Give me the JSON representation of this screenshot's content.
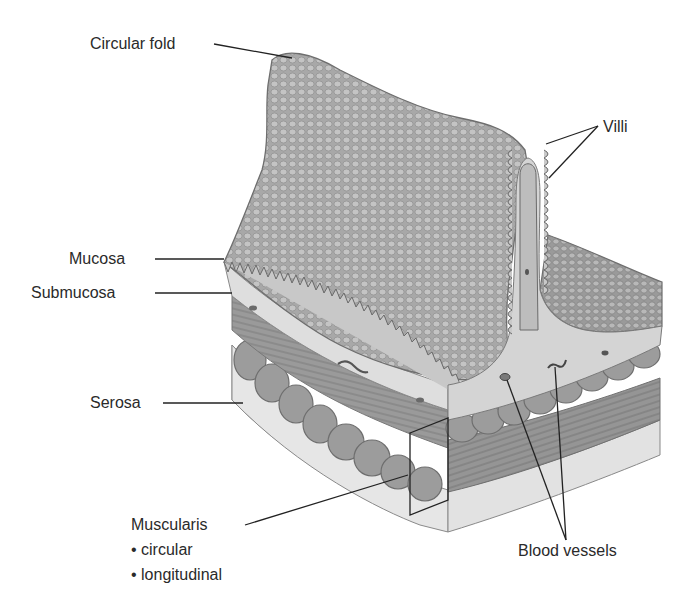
{
  "diagram": {
    "colors": {
      "background": "#ffffff",
      "label_text": "#2a2a2a",
      "leader_line": "#222222",
      "mucosa_surface": "#a9a9a9",
      "submucosa": "#dcdcdc",
      "muscle_dark": "#8a8a8a",
      "muscle_mid": "#9c9c9c",
      "serosa": "#e6e6e6"
    },
    "labels": {
      "circular_fold": "Circular fold",
      "villi": "Villi",
      "mucosa": "Mucosa",
      "submucosa": "Submucosa",
      "serosa": "Serosa",
      "muscularis": "Muscularis",
      "muscularis_circular": "• circular",
      "muscularis_longitudinal": "• longitudinal",
      "blood_vessels": "Blood vessels"
    }
  }
}
